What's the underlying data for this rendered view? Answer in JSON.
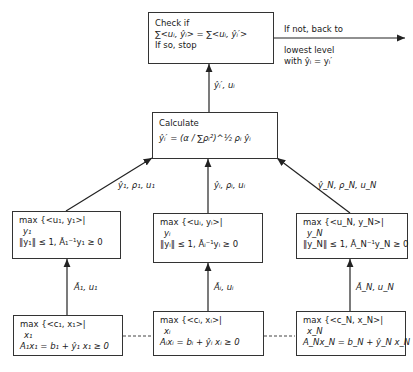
{
  "top_box": {
    "line1": "Check if",
    "line2": "∑<uᵢ, ŷᵢ> = ∑<uᵢ, ŷᵢ′>",
    "line3": "If so, stop"
  },
  "exit_arrow": {
    "label_above": "If not, back to",
    "label_below_1": "lowest level",
    "label_below_2": "with ŷᵢ = yᵢ′"
  },
  "top_edge_label": "ŷᵢ′, uᵢ",
  "calc_box": {
    "line1": "Calculate",
    "line2": "ŷᵢ′ = (α / ∑ρᵢ²)^½ ρᵢ ŷᵢ"
  },
  "mid_edge_labels": {
    "left": "ŷ₁, ρ₁, u₁",
    "center": "ŷᵢ, ρᵢ, uᵢ",
    "right": "ŷ_N, ρ_N, u_N"
  },
  "mid_boxes": [
    {
      "line1": "max {<u₁, y₁>|",
      "line2": "y₁",
      "line3": "‖y₁‖ ≤ 1,  Ã₁⁻¹y₁ ≥ 0"
    },
    {
      "line1": "max {<uᵢ, yᵢ>|",
      "line2": "yᵢ",
      "line3": "‖yᵢ‖ ≤ 1,  Ãᵢ⁻¹yᵢ ≥ 0"
    },
    {
      "line1": "max {<u_N, y_N>|",
      "line2": "y_N",
      "line3": "‖y_N‖ ≤ 1,  Ã_N⁻¹y_N ≥ 0"
    }
  ],
  "low_edge_labels": {
    "left": "Ã₁,  u₁",
    "center": "Ãᵢ,  uᵢ",
    "right": "Ã_N,  u_N"
  },
  "bottom_boxes": [
    {
      "line1": "max {<c₁, x₁>|",
      "line2": "x₁",
      "line3": "A₁x₁ = b₁ + ŷ₁    x₁ ≥ 0"
    },
    {
      "line1": "max {<cᵢ, xᵢ>|",
      "line2": "xᵢ",
      "line3": "Aᵢxᵢ = bᵢ + ŷᵢ    xᵢ ≥ 0"
    },
    {
      "line1": "max {<c_N, x_N>|",
      "line2": "x_N",
      "line3": "A_Nx_N = b_N + ŷ_N    x_N ≥ 0"
    }
  ]
}
